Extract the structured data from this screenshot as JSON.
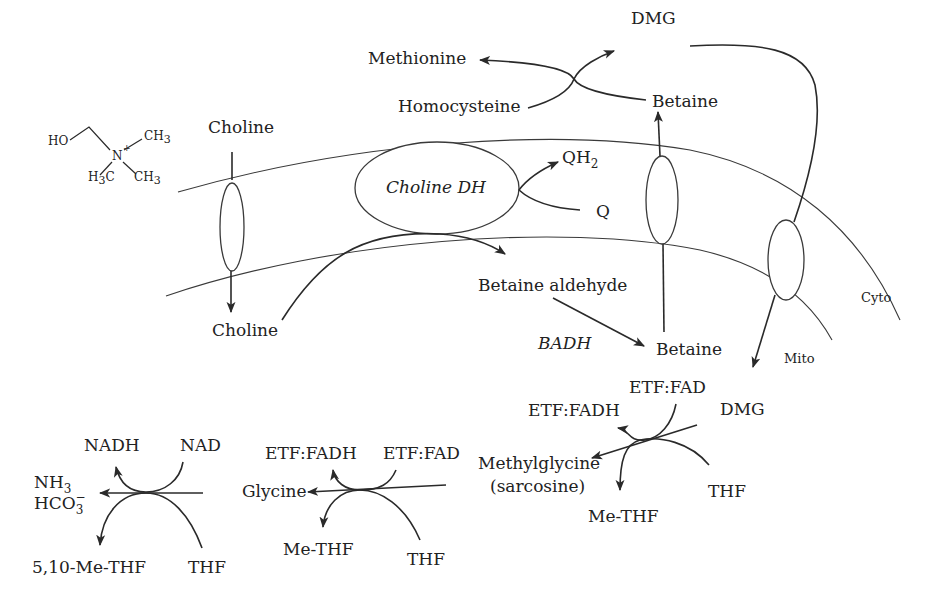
{
  "diagram": {
    "structure": {
      "ho": "HO",
      "n_plus": "N",
      "plus": "+",
      "ch3_top": "CH",
      "ch3_top_sub": "3",
      "h3c": "H",
      "h3c_sub": "3",
      "h3c_c": "C",
      "ch3_bottom": "CH",
      "ch3_bottom_sub": "3"
    },
    "compartments": {
      "cyto": "Cyto",
      "mito": "Mito"
    },
    "nodes": {
      "choline_outside": "Choline",
      "choline_inside": "Choline",
      "choline_dh": "Choline DH",
      "qh2": "QH",
      "qh2_sub": "2",
      "q": "Q",
      "betaine_aldehyde": "Betaine aldehyde",
      "badh": "BADH",
      "betaine_mito": "Betaine",
      "betaine_cyto": "Betaine",
      "methionine": "Methionine",
      "homocysteine": "Homocysteine",
      "dmg_cyto": "DMG",
      "dmg_mito": "DMG",
      "etf_fad_1": "ETF:FAD",
      "etf_fadh_1": "ETF:FADH",
      "methylglycine": "Methylglycine",
      "sarcosine": "(sarcosine)",
      "thf_1": "THF",
      "me_thf_1": "Me-THF",
      "etf_fad_2": "ETF:FAD",
      "etf_fadh_2": "ETF:FADH",
      "glycine": "Glycine",
      "thf_2": "THF",
      "me_thf_2": "Me-THF",
      "nad": "NAD",
      "nadh": "NADH",
      "nh3": "NH",
      "nh3_sub": "3",
      "hco3": "HCO",
      "hco3_sub": "3",
      "hco3_sup": "−",
      "thf_3": "THF",
      "me_thf_3": "5,10-Me-THF"
    },
    "colors": {
      "line": "#2a2a2a",
      "text": "#222222",
      "background": "#ffffff"
    }
  }
}
